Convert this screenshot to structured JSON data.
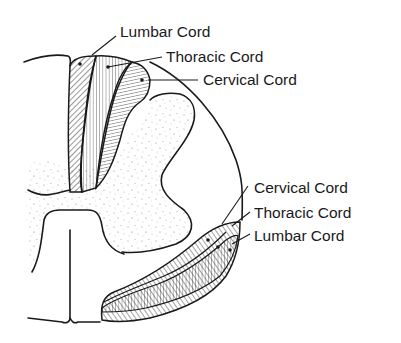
{
  "figure": {
    "colors": {
      "ink": "#1a1a1a",
      "background": "#ffffff",
      "stipple": "#8a8a8a"
    }
  },
  "dorsal_tract": {
    "labels": [
      {
        "id": "lumbar",
        "text": "Lumbar Cord"
      },
      {
        "id": "thoracic",
        "text": "Thoracic Cord"
      },
      {
        "id": "cervical",
        "text": "Cervical Cord"
      }
    ]
  },
  "ventrolateral_tract": {
    "labels": [
      {
        "id": "cervical",
        "text": "Cervical Cord"
      },
      {
        "id": "thoracic",
        "text": "Thoracic Cord"
      },
      {
        "id": "lumbar",
        "text": "Lumbar Cord"
      }
    ]
  }
}
